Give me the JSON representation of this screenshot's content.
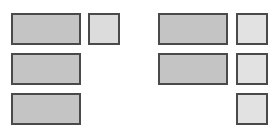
{
  "diagram": {
    "colors": {
      "border": "#4a4a4a",
      "wide_block_fill": "#c4c4c4",
      "left_square_fill": "#dcdcdc",
      "right_square_fill": "#e2e2e2",
      "background": "#ffffff"
    },
    "left_group": {
      "wide_blocks": [
        {
          "row": 1,
          "x": 11,
          "y": 13,
          "w": 70,
          "h": 32
        },
        {
          "row": 2,
          "x": 11,
          "y": 53,
          "w": 70,
          "h": 32
        },
        {
          "row": 3,
          "x": 11,
          "y": 93,
          "w": 70,
          "h": 32
        }
      ],
      "squares": [
        {
          "row": 1,
          "x": 88,
          "y": 13,
          "w": 32,
          "h": 32
        }
      ]
    },
    "right_group": {
      "wide_blocks": [
        {
          "row": 1,
          "x": 158,
          "y": 13,
          "w": 70,
          "h": 32
        },
        {
          "row": 2,
          "x": 158,
          "y": 53,
          "w": 70,
          "h": 32
        }
      ],
      "squares": [
        {
          "row": 1,
          "x": 236,
          "y": 13,
          "w": 32,
          "h": 32
        },
        {
          "row": 2,
          "x": 236,
          "y": 53,
          "w": 32,
          "h": 32
        },
        {
          "row": 3,
          "x": 236,
          "y": 93,
          "w": 32,
          "h": 32
        }
      ]
    }
  }
}
